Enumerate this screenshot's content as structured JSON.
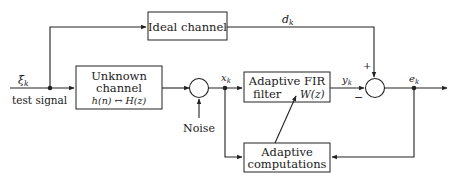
{
  "diagram": {
    "blocks": {
      "ideal_channel": {
        "label": "Ideal channel"
      },
      "unknown_channel": {
        "line1": "Unknown",
        "line2": "channel",
        "line3": "h(n) ↔ H(z)"
      },
      "adaptive_filter": {
        "line1": "Adaptive FIR",
        "line2": "filter",
        "transfer": "W(z)"
      },
      "adaptive_computations": {
        "line1": "Adaptive",
        "line2": "computations"
      }
    },
    "signals": {
      "input_symbol": "ξ",
      "input_sub": "k",
      "input_caption": "test signal",
      "noise": "Noise",
      "x": "x",
      "x_sub": "k",
      "y": "y",
      "y_sub": "k",
      "d": "d",
      "d_sub": "k",
      "e": "e",
      "e_sub": "k"
    },
    "summing_signs": {
      "plus": "+",
      "minus": "−"
    },
    "colors": {
      "stroke": "#222222",
      "text": "#1a1a1a",
      "background": "#ffffff"
    }
  }
}
